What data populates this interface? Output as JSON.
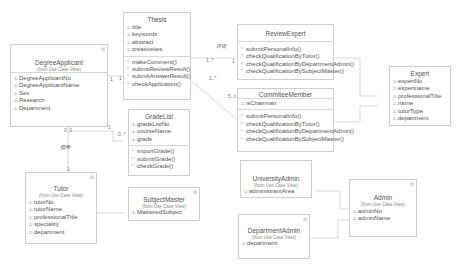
{
  "diagram": {
    "type": "uml-class-diagram",
    "classes": {
      "thesis": {
        "name": "Thesis",
        "attributes": [
          "title",
          "keywords",
          "abstract",
          "creativeties"
        ],
        "operations": [
          "makeComment()",
          "submitReviewResult()",
          "submitAnswerResult()",
          "checkApplication()"
        ]
      },
      "degreeApplicant": {
        "name": "DegreeApplicant",
        "stereotype": "(from Use Case View)",
        "attributes": [
          "DegreeApplicantNo",
          "DegreeApplicantName",
          "Sex",
          "Research",
          "Department"
        ]
      },
      "gradeList": {
        "name": "GradeList",
        "attributes": [
          "gradeListNo",
          "courseName",
          "grade"
        ],
        "operations": [
          "importGrade()",
          "submitGrade()",
          "checkGrade()"
        ]
      },
      "reviewExpert": {
        "name": "ReviewExpert",
        "operations": [
          "submitPersonalInfo()",
          "checkQualificationByTutor()",
          "checkQualificationByDepartmentAdmin()",
          "checkQualificationBySubjectMaster()"
        ]
      },
      "committeeMember": {
        "name": "CommiteeMember",
        "attributes": [
          "isChairman"
        ],
        "operations": [
          "submitPersonalInfo()",
          "checkQualificationByTutor()",
          "checkQualificationByDepartmentAdmin()",
          "checkQualificationBySubjectMaster()"
        ]
      },
      "expert": {
        "name": "Expert",
        "attributes": [
          "expertNo",
          "expertname",
          "professionalTitle",
          "name",
          "tutorType",
          "department"
        ]
      },
      "tutor": {
        "name": "Tutor",
        "stereotype": "(from Use Case View)",
        "attributes": [
          "tutorNo",
          "tutorName",
          "professionalTitle",
          "speciality",
          "department"
        ]
      },
      "subjectMaster": {
        "name": "SubjectMaster",
        "stereotype": "(from Use Case View)",
        "attributes": [
          "MasteredSubject"
        ]
      },
      "universityAdmin": {
        "name": "UniversityAdmin",
        "stereotype": "(from Use Case View)",
        "attributes": [
          "administrantArea"
        ]
      },
      "departmentAdmin": {
        "name": "DepartmentAdmin",
        "stereotype": "(from Use Case View)",
        "attributes": [
          "department"
        ]
      },
      "admin": {
        "name": "Admin",
        "stereotype": "(from Use Case View)",
        "attributes": [
          "adminNo",
          "adminName"
        ]
      }
    },
    "labels": {
      "review_assoc": "评阅",
      "guide_assoc": "指导",
      "m_thesis_review": "1..*",
      "m_review_thesis": "1",
      "m_thesis_committee": "1..*",
      "m_committee": "5..n",
      "m_applicant_right": "1",
      "m_applicant_bottom_left": "0..1",
      "m_applicant_bottom_right": "1",
      "m_thesis_left": "1",
      "m_gradelist_left": "0..*",
      "m_tutor_top": "1"
    },
    "icons": {
      "attribute": "attribute-lock-icon",
      "operation": "operation-icon"
    },
    "colors": {
      "border": "#cfcfcf",
      "text": "#555555",
      "line": "#c8c8c8"
    }
  }
}
